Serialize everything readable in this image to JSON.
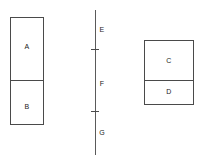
{
  "diagram": {
    "title": "",
    "background_color": "#ffffff",
    "stroke_color": "#4a4a4a",
    "text_color": "#1a1a1a",
    "left_block": {
      "name": "left-stacked-rectangle",
      "x": 10,
      "y": 17,
      "width": 34,
      "height": 108,
      "divider_y": 80,
      "cells": [
        {
          "label": "A",
          "label_x": 27,
          "label_y": 43
        },
        {
          "label": "B",
          "label_x": 27,
          "label_y": 103
        }
      ]
    },
    "center_axis": {
      "name": "center-vertical-axis",
      "x": 95,
      "y_top": 10,
      "y_bottom": 155,
      "ticks": [
        49,
        111
      ],
      "tick_half_width": 4,
      "segments": [
        {
          "label": "E",
          "label_x": 102,
          "label_y": 26
        },
        {
          "label": "F",
          "label_x": 102,
          "label_y": 80
        },
        {
          "label": "G",
          "label_x": 102,
          "label_y": 129
        }
      ]
    },
    "right_block": {
      "name": "right-stacked-rectangle",
      "x": 144,
      "y": 40,
      "width": 50,
      "height": 65,
      "divider_y": 80,
      "cells": [
        {
          "label": "C",
          "label_x": 169,
          "label_y": 57
        },
        {
          "label": "D",
          "label_x": 169,
          "label_y": 88
        }
      ]
    }
  }
}
